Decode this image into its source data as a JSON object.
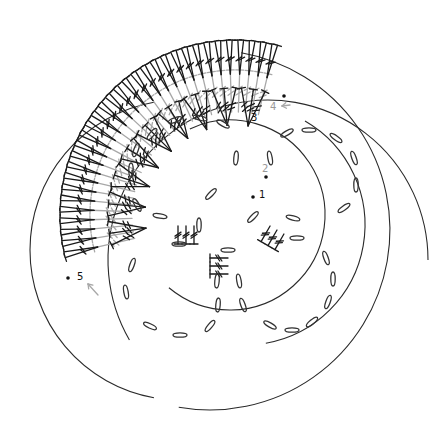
{
  "diagram": {
    "type": "crochet-symbol-chart",
    "background": "#ffffff",
    "colors": {
      "dark_stitch": "#1a1a1a",
      "grey_stitch": "#a8a8a8",
      "outline": "#2a2a2a"
    },
    "round_labels": [
      {
        "id": "round-1",
        "text": "1",
        "x": 259,
        "y": 198,
        "grey": false
      },
      {
        "id": "round-2",
        "text": "2",
        "x": 262,
        "y": 172,
        "grey": true
      },
      {
        "id": "round-3",
        "text": "3",
        "x": 251,
        "y": 121,
        "grey": false
      },
      {
        "id": "round-4",
        "text": "4",
        "x": 270,
        "y": 110,
        "grey": true
      },
      {
        "id": "round-5",
        "text": "5",
        "x": 77,
        "y": 280,
        "grey": false
      }
    ],
    "start_dots": [
      {
        "x": 253,
        "y": 197
      },
      {
        "x": 266,
        "y": 177
      },
      {
        "x": 284,
        "y": 96
      },
      {
        "x": 68,
        "y": 278
      }
    ],
    "arrows": [
      {
        "x1": 98,
        "y1": 295,
        "x2": 88,
        "y2": 284
      },
      {
        "x1": 290,
        "y1": 105,
        "x2": 282,
        "y2": 106
      }
    ],
    "arcs": [
      {
        "name": "outer-large-circle",
        "cx": 210,
        "cy": 230,
        "r": 180,
        "start": -80,
        "end": 100
      },
      {
        "name": "left-large-circle",
        "cx": 180,
        "cy": 250,
        "r": 150,
        "start": 100,
        "end": 260
      },
      {
        "name": "lower-circle",
        "cx": 268,
        "cy": 260,
        "r": 160,
        "start": 150,
        "end": 360
      },
      {
        "name": "inner-right-arc",
        "cx": 245,
        "cy": 225,
        "r": 120,
        "start": -60,
        "end": 80
      },
      {
        "name": "mid-arc",
        "cx": 230,
        "cy": 215,
        "r": 95,
        "start": -115,
        "end": 130
      }
    ],
    "chains": [
      {
        "x": 175,
        "y": 120,
        "rx": 7,
        "ry": 2.2,
        "rot": -20
      },
      {
        "x": 200,
        "y": 118,
        "rx": 7,
        "ry": 2.2,
        "rot": 15
      },
      {
        "x": 223,
        "y": 124,
        "rx": 7,
        "ry": 2.2,
        "rot": 30
      },
      {
        "x": 152,
        "y": 134,
        "rx": 7,
        "ry": 2.2,
        "rot": -50
      },
      {
        "x": 136,
        "y": 150,
        "rx": 7,
        "ry": 2.2,
        "rot": -70
      },
      {
        "x": 131,
        "y": 170,
        "rx": 7,
        "ry": 2.2,
        "rot": -90
      },
      {
        "x": 137,
        "y": 205,
        "rx": 7,
        "ry": 2.2,
        "rot": 60
      },
      {
        "x": 236,
        "y": 158,
        "rx": 7,
        "ry": 2.2,
        "rot": -85
      },
      {
        "x": 270,
        "y": 158,
        "rx": 7,
        "ry": 2.2,
        "rot": 80
      },
      {
        "x": 287,
        "y": 133,
        "rx": 7,
        "ry": 2.2,
        "rot": -30
      },
      {
        "x": 309,
        "y": 130,
        "rx": 7,
        "ry": 2.2,
        "rot": 0
      },
      {
        "x": 336,
        "y": 138,
        "rx": 7,
        "ry": 2.2,
        "rot": 35
      },
      {
        "x": 354,
        "y": 158,
        "rx": 7,
        "ry": 2.2,
        "rot": 70
      },
      {
        "x": 356,
        "y": 185,
        "rx": 7,
        "ry": 2.2,
        "rot": 90
      },
      {
        "x": 344,
        "y": 208,
        "rx": 7,
        "ry": 2.2,
        "rot": -35
      },
      {
        "x": 211,
        "y": 194,
        "rx": 7,
        "ry": 2.2,
        "rot": -45
      },
      {
        "x": 160,
        "y": 216,
        "rx": 7,
        "ry": 2.2,
        "rot": 10
      },
      {
        "x": 179,
        "y": 244,
        "rx": 7,
        "ry": 2.2,
        "rot": 0
      },
      {
        "x": 228,
        "y": 250,
        "rx": 7,
        "ry": 2.2,
        "rot": 0
      },
      {
        "x": 253,
        "y": 217,
        "rx": 7,
        "ry": 2.2,
        "rot": -45
      },
      {
        "x": 293,
        "y": 218,
        "rx": 7,
        "ry": 2.2,
        "rot": 15
      },
      {
        "x": 297,
        "y": 238,
        "rx": 7,
        "ry": 2.2,
        "rot": 0
      },
      {
        "x": 217,
        "y": 281,
        "rx": 7,
        "ry": 2.2,
        "rot": -85
      },
      {
        "x": 239,
        "y": 281,
        "rx": 7,
        "ry": 2.2,
        "rot": 80
      },
      {
        "x": 218,
        "y": 305,
        "rx": 7,
        "ry": 2.2,
        "rot": -85
      },
      {
        "x": 243,
        "y": 305,
        "rx": 7,
        "ry": 2.2,
        "rot": 70
      },
      {
        "x": 210,
        "y": 326,
        "rx": 7,
        "ry": 2.2,
        "rot": -50
      },
      {
        "x": 180,
        "y": 335,
        "rx": 7,
        "ry": 2.2,
        "rot": 0
      },
      {
        "x": 150,
        "y": 326,
        "rx": 7,
        "ry": 2.2,
        "rot": 25
      },
      {
        "x": 126,
        "y": 292,
        "rx": 7,
        "ry": 2.2,
        "rot": 80
      },
      {
        "x": 132,
        "y": 265,
        "rx": 7,
        "ry": 2.2,
        "rot": -70
      },
      {
        "x": 270,
        "y": 325,
        "rx": 7,
        "ry": 2.2,
        "rot": 30
      },
      {
        "x": 292,
        "y": 330,
        "rx": 7,
        "ry": 2.2,
        "rot": 0
      },
      {
        "x": 312,
        "y": 322,
        "rx": 7,
        "ry": 2.2,
        "rot": -40
      },
      {
        "x": 328,
        "y": 302,
        "rx": 7,
        "ry": 2.2,
        "rot": -70
      },
      {
        "x": 333,
        "y": 279,
        "rx": 7,
        "ry": 2.2,
        "rot": 90
      },
      {
        "x": 326,
        "y": 258,
        "rx": 7,
        "ry": 2.2,
        "rot": 70
      },
      {
        "x": 199,
        "y": 225,
        "rx": 7,
        "ry": 2.2,
        "rot": -90
      }
    ],
    "fan": {
      "center": {
        "x": 235,
        "y": 215
      },
      "outer_r": 175,
      "mid_r": 135,
      "inner_r": 95,
      "start_angle": 165,
      "end_angle": 285,
      "outer_count": 64,
      "grey_count": 32,
      "cluster_count": 9
    },
    "center_clusters": [
      {
        "x": 186,
        "y": 226,
        "angle": -90
      },
      {
        "x": 228,
        "y": 266,
        "angle": 0
      },
      {
        "x": 277,
        "y": 230,
        "angle": -60
      }
    ]
  }
}
